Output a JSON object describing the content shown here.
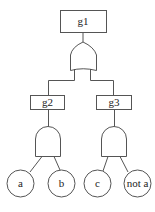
{
  "diagram": {
    "type": "fault-tree",
    "top_event": {
      "id": "g1",
      "label": "g1",
      "gate": "OR"
    },
    "intermediate_events": [
      {
        "id": "g2",
        "label": "g2",
        "gate": "AND",
        "inputs": [
          "a",
          "b"
        ]
      },
      {
        "id": "g3",
        "label": "g3",
        "gate": "AND",
        "inputs": [
          "c",
          "not a"
        ]
      }
    ],
    "basic_events": [
      {
        "id": "a",
        "label": "a"
      },
      {
        "id": "b",
        "label": "b"
      },
      {
        "id": "c",
        "label": "c"
      },
      {
        "id": "not_a",
        "label": "not a"
      }
    ],
    "colors": {
      "stroke": "#555555",
      "fill": "#ffffff",
      "text": "#222222"
    }
  }
}
